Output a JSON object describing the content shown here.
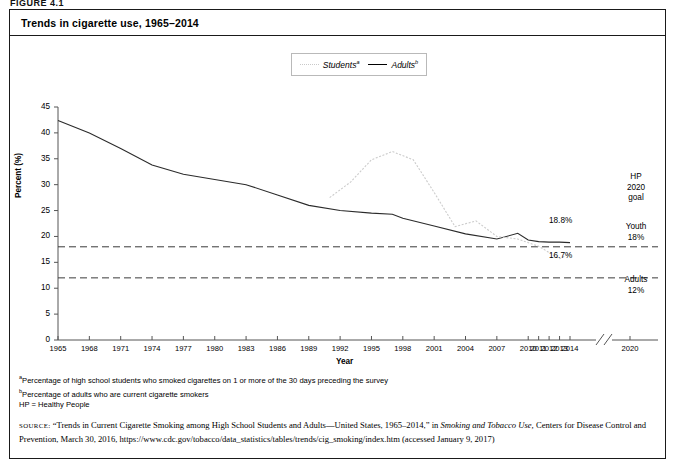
{
  "figure": {
    "label": "FIGURE 4.1",
    "title": "Trends in cigarette use, 1965–2014"
  },
  "legend": {
    "items": [
      {
        "label": "Students",
        "note": "a",
        "style": "dotted-gray"
      },
      {
        "label": "Adults",
        "note": "b",
        "style": "solid-black"
      }
    ]
  },
  "annotations": {
    "hp_goal": "HP\n2020\ngoal",
    "hp_goal_lines": [
      "HP",
      "2020",
      "goal"
    ],
    "youth_lines": [
      "Youth",
      "18%"
    ],
    "adults_lines": [
      "Adults",
      "12%"
    ],
    "adults_end_label": "18.8%",
    "students_end_label": "16.7%"
  },
  "notes": [
    {
      "marker": "a",
      "text": "Percentage of high school students who smoked cigarettes on 1 or more of the 30 days preceding the survey"
    },
    {
      "marker": "b",
      "text": "Percentage of adults who are current cigarette smokers"
    },
    {
      "marker": "",
      "text": "HP = Healthy People"
    }
  ],
  "source": {
    "prefix": "SOURCE:",
    "line1a": "“Trends in Current Cigarette Smoking among High School Students and Adults—United States, 1965–2014,” in ",
    "line1b": "Smoking and Tobacco Use,",
    "line2": "Centers for Disease Control and Prevention, March 30, 2016, https://www.cdc.gov/tobacco/data_statistics/tables/trends/cig_smoking/index.htm",
    "line3": "(accessed January 9, 2017)"
  },
  "chart_data": {
    "type": "line",
    "title": "Trends in cigarette use, 1965–2014",
    "xlabel": "Year",
    "ylabel": "Percent (%)",
    "ylim": [
      0,
      45
    ],
    "ytick_values": [
      0,
      5,
      10,
      15,
      20,
      25,
      30,
      35,
      40,
      45
    ],
    "xtick_labels": [
      "1965",
      "1968",
      "1971",
      "1974",
      "1977",
      "1980",
      "1983",
      "1986",
      "1989",
      "1992",
      "1995",
      "1998",
      "2001",
      "2004",
      "2007",
      "2010",
      "2011",
      "2012",
      "2013",
      "2014",
      "2020"
    ],
    "axis_break_after": "2014",
    "grid": false,
    "legend_position": "top-center",
    "series": [
      {
        "name": "Adults",
        "note": "b",
        "color": "#2b2b2b",
        "style": "solid",
        "x": [
          1965,
          1968,
          1971,
          1974,
          1977,
          1980,
          1983,
          1986,
          1989,
          1992,
          1995,
          1997,
          1998,
          2001,
          2004,
          2007,
          2009,
          2010,
          2011,
          2012,
          2013,
          2014
        ],
        "values": [
          42.4,
          40.0,
          37.0,
          33.8,
          32.0,
          31.0,
          30.0,
          28.0,
          26.0,
          25.0,
          24.5,
          24.3,
          23.5,
          22.0,
          20.5,
          19.5,
          20.6,
          19.3,
          19.0,
          18.9,
          18.9,
          18.8
        ]
      },
      {
        "name": "Students",
        "note": "a",
        "color": "#cccccc",
        "style": "dotted",
        "x": [
          1991,
          1993,
          1995,
          1997,
          1999,
          2001,
          2003,
          2005,
          2007,
          2009,
          2011,
          2013,
          2014
        ],
        "values": [
          27.5,
          30.5,
          34.8,
          36.4,
          34.8,
          28.5,
          21.9,
          23.0,
          20.0,
          19.5,
          18.1,
          15.7,
          16.7
        ]
      }
    ],
    "reference_lines": [
      {
        "label": "Youth 18%",
        "value": 18,
        "style": "dashed"
      },
      {
        "label": "Adults 12%",
        "value": 12,
        "style": "dashed"
      }
    ],
    "data_labels": [
      {
        "series": "Adults",
        "x": 2014,
        "value": 18.8,
        "text": "18.8%"
      },
      {
        "series": "Students",
        "x": 2014,
        "value": 16.7,
        "text": "16.7%"
      }
    ]
  }
}
